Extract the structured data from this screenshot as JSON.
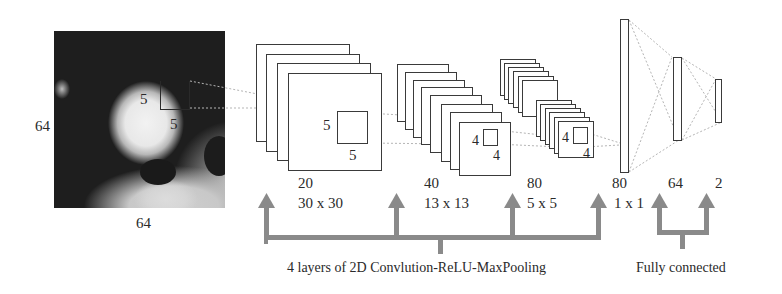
{
  "diagram": {
    "input": {
      "image": "grayscale-ct-patch",
      "height_label": "64",
      "width_label": "64",
      "kernel": {
        "top_label": "5",
        "bottom_label": "5"
      }
    },
    "conv_layers": [
      {
        "channels": "20",
        "size": "30 x 30",
        "kernel_left": "5",
        "kernel_bottom": "5",
        "stack_count": 4
      },
      {
        "channels": "40",
        "size": "13 x 13",
        "kernel_left": "4",
        "kernel_bottom": "4",
        "stack_count": 8
      },
      {
        "channels": "80",
        "size": "5 x 5",
        "kernel_left": "4",
        "kernel_bottom": "4",
        "stack_count": 12
      },
      {
        "channels": "80",
        "size": "1 x 1"
      }
    ],
    "fc_layers": [
      {
        "units": "64"
      },
      {
        "units": "2"
      }
    ],
    "group_labels": {
      "conv": "4 layers of 2D Convlution-ReLU-MaxPooling",
      "fc": "Fully connected"
    },
    "colors": {
      "arrow": "#8a8a8a",
      "stroke": "#3a3a3a",
      "dotted": "#b5b5b5"
    }
  }
}
